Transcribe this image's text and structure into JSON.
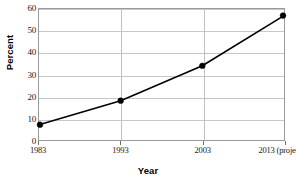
{
  "chart_data": {
    "type": "line",
    "title": "",
    "xlabel": "Year",
    "ylabel": "Percent",
    "categories": [
      "1983",
      "1993",
      "2003",
      "2013 (projected)"
    ],
    "values": [
      7,
      18,
      34,
      57
    ],
    "series": [
      {
        "name": "Percent",
        "values": [
          7,
          18,
          34,
          57
        ]
      }
    ],
    "ylim": [
      0,
      60
    ],
    "yticks": [
      0,
      10,
      20,
      30,
      40,
      50,
      60
    ],
    "ytick_labels": [
      "0",
      "10",
      "20",
      "30",
      "40",
      "50",
      "60"
    ],
    "grid": "horizontal-and-vertical",
    "legend": "none",
    "line_color": "#000000",
    "marker_color": "#000000",
    "grid_color": "#c8c8c8",
    "frame_color": "#9a9a9a",
    "background": "#ffffff"
  }
}
